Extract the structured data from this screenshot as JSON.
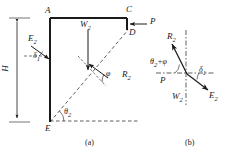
{
  "figure": {
    "type": "engineering-diagram",
    "subfigures": [
      {
        "id": "a",
        "caption": "(a)",
        "title": "wall geometry and failure wedge"
      },
      {
        "id": "b",
        "caption": "(b)",
        "title": "force polygon"
      }
    ]
  },
  "panel_a": {
    "points": {
      "A": "A",
      "C": "C",
      "D": "D",
      "E": "E"
    },
    "dimensions": {
      "height": "H"
    },
    "forces": {
      "earth_pressure": "E",
      "earth_pressure_sub": "2",
      "weight": "W",
      "weight_sub": "2",
      "reaction": "R",
      "reaction_sub": "2",
      "surcharge": "P"
    },
    "angles": {
      "delta1": "δ",
      "delta1_sub": "1",
      "theta2": "θ",
      "theta2_sub": "2",
      "phi": "φ"
    }
  },
  "panel_b": {
    "forces": {
      "reaction": "R",
      "reaction_sub": "2",
      "earth_pressure": "E",
      "earth_pressure_sub": "2",
      "weight": "W",
      "weight_sub": "2",
      "surcharge": "P"
    },
    "angles": {
      "theta2_plus_phi": "θ",
      "theta2_plus_phi_sub": "2",
      "theta2_plus_phi_tail": "+φ",
      "delta1": "δ",
      "delta1_sub": "1"
    }
  },
  "colors": {
    "stroke": "#1a1a1a",
    "background": "#ffffff"
  }
}
